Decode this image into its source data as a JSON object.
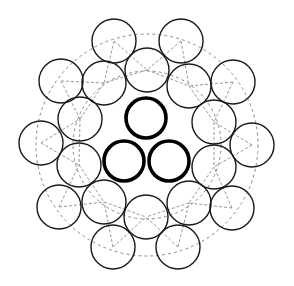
{
  "diagram": {
    "colors": {
      "stroke": "#1a1a1a",
      "dash": "#8a8a8a",
      "background": "#ffffff"
    },
    "pitch_circles": [
      {
        "cx": 147,
        "cy": 145,
        "r": 111
      },
      {
        "cx": 147,
        "cy": 145,
        "r": 74
      }
    ],
    "core_wires": [
      {
        "cx": 146,
        "cy": 118,
        "r": 20
      },
      {
        "cx": 124,
        "cy": 161,
        "r": 20
      },
      {
        "cx": 169,
        "cy": 161,
        "r": 20
      }
    ],
    "inner_wires": [
      {
        "cx": 147,
        "cy": 70,
        "r": 22
      },
      {
        "cx": 104,
        "cy": 83,
        "r": 22
      },
      {
        "cx": 189,
        "cy": 86,
        "r": 22
      },
      {
        "cx": 80,
        "cy": 119,
        "r": 22
      },
      {
        "cx": 214,
        "cy": 122,
        "r": 22
      },
      {
        "cx": 79,
        "cy": 165,
        "r": 22
      },
      {
        "cx": 214,
        "cy": 167,
        "r": 22
      },
      {
        "cx": 104,
        "cy": 202,
        "r": 22
      },
      {
        "cx": 189,
        "cy": 203,
        "r": 22
      },
      {
        "cx": 146,
        "cy": 217,
        "r": 22
      }
    ],
    "outer_wires": [
      {
        "cx": 114,
        "cy": 41,
        "r": 22
      },
      {
        "cx": 181,
        "cy": 41,
        "r": 22
      },
      {
        "cx": 61,
        "cy": 81,
        "r": 22
      },
      {
        "cx": 233,
        "cy": 82,
        "r": 22
      },
      {
        "cx": 41,
        "cy": 143,
        "r": 22
      },
      {
        "cx": 252,
        "cy": 145,
        "r": 22
      },
      {
        "cx": 59,
        "cy": 207,
        "r": 22
      },
      {
        "cx": 232,
        "cy": 208,
        "r": 22
      },
      {
        "cx": 113,
        "cy": 247,
        "r": 22
      },
      {
        "cx": 178,
        "cy": 247,
        "r": 22
      }
    ]
  }
}
